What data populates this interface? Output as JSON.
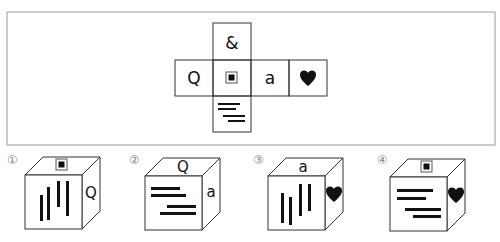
{
  "question": {
    "net": {
      "faces": {
        "top": "&",
        "left": "Q",
        "center": "square-in-square",
        "right": "a",
        "far_right": "heart",
        "bottom": "horizontal-lines"
      },
      "labels": {
        "top": "&",
        "left": "Q",
        "right": "a",
        "far_right": "♥"
      }
    }
  },
  "options": [
    {
      "number": "①",
      "top": "square-in-square",
      "front": "vertical-bars",
      "side": "Q",
      "side_label": "Q"
    },
    {
      "number": "②",
      "top": "Q",
      "top_label": "Q",
      "front": "horizontal-lines",
      "side": "a",
      "side_label": "a"
    },
    {
      "number": "③",
      "top": "a",
      "top_label": "a",
      "front": "vertical-bars",
      "side": "heart",
      "side_label": "♥"
    },
    {
      "number": "④",
      "top": "square-in-square",
      "front": "horizontal-lines",
      "side": "heart",
      "side_label": "♥"
    }
  ],
  "colors": {
    "line": "#333333",
    "fill": "#111111",
    "frame": "#9a9a9a",
    "number": "#888888"
  }
}
